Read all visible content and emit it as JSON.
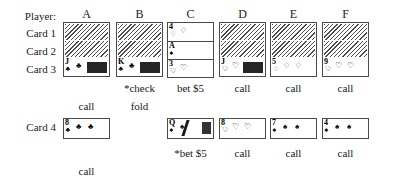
{
  "table": {
    "row_labels": [
      {
        "text": "Player:",
        "x": 8,
        "y": 11,
        "w": 48
      },
      {
        "text": "Card 1",
        "x": 8,
        "y": 28,
        "w": 48
      },
      {
        "text": "Card 2",
        "x": 8,
        "y": 46,
        "w": 48
      },
      {
        "text": "Card 3",
        "x": 8,
        "y": 64,
        "w": 48
      },
      {
        "text": "Card 4",
        "x": 8,
        "y": 122,
        "w": 48
      }
    ],
    "columns": [
      {
        "id": "A",
        "label": "A",
        "header_x": 63,
        "stack_x": 63
      },
      {
        "id": "B",
        "label": "B",
        "header_x": 116,
        "stack_x": 116
      },
      {
        "id": "C",
        "label": "C",
        "header_x": 167,
        "stack_x": 167
      },
      {
        "id": "D",
        "label": "D",
        "header_x": 219,
        "stack_x": 219
      },
      {
        "id": "E",
        "label": "E",
        "header_x": 270,
        "stack_x": 270
      },
      {
        "id": "F",
        "label": "F",
        "header_x": 322,
        "stack_x": 322
      }
    ],
    "header_y": 8,
    "stack_top": 22,
    "card4_top": 118
  },
  "hands": [
    {
      "player": "A",
      "hole_cards": [
        {
          "facedown": true
        },
        {
          "facedown": true
        }
      ],
      "card3": {
        "rank": "J",
        "suit": "♣",
        "suit_name": "clubs",
        "pips": 1,
        "obscured": true,
        "smudge": "wide"
      },
      "card4": {
        "rank": "8",
        "suit": "♣",
        "suit_name": "clubs",
        "pips": 2,
        "obscured": false
      },
      "actions": [
        {
          "text": "call",
          "round": 2
        },
        {
          "text": "call",
          "round": 4
        }
      ]
    },
    {
      "player": "B",
      "hole_cards": [
        {
          "facedown": true
        },
        {
          "facedown": true
        }
      ],
      "card3": {
        "rank": "K",
        "suit": "♣",
        "suit_name": "clubs",
        "pips": 1,
        "obscured": true,
        "smudge": "wide"
      },
      "card4": null,
      "actions": [
        {
          "text": "*check",
          "round": 1
        },
        {
          "text": "fold",
          "round": 2
        }
      ]
    },
    {
      "player": "C",
      "hole_cards": [
        {
          "rank": "4",
          "suit": "♢",
          "suit_name": "diamonds",
          "pips": 1,
          "facedown": false
        },
        {
          "rank": "A",
          "suit": "♠",
          "suit_name": "spades",
          "pips": 0,
          "facedown": false
        }
      ],
      "card3": {
        "rank": "3",
        "suit": "♡",
        "suit_name": "hearts",
        "pips": 1,
        "obscured": false
      },
      "card4": {
        "rank": "Q",
        "suit": "♠",
        "suit_name": "spades",
        "pips": 1,
        "obscured": true,
        "smudge": "slash"
      },
      "actions": [
        {
          "text": "bet $5",
          "round": 1
        },
        {
          "text": "*bet $5",
          "round": 3
        }
      ]
    },
    {
      "player": "D",
      "hole_cards": [
        {
          "facedown": true
        },
        {
          "facedown": true
        }
      ],
      "card3": {
        "rank": "J",
        "suit": "♡",
        "suit_name": "hearts",
        "pips": 1,
        "obscured": true,
        "smudge": "wide"
      },
      "card4": {
        "rank": "8",
        "suit": "♡",
        "suit_name": "hearts",
        "pips": 2,
        "obscured": false
      },
      "actions": [
        {
          "text": "call",
          "round": 1
        },
        {
          "text": "call",
          "round": 3
        }
      ]
    },
    {
      "player": "E",
      "hole_cards": [
        {
          "facedown": true
        },
        {
          "facedown": true
        }
      ],
      "card3": {
        "rank": "5",
        "suit": "♢",
        "suit_name": "diamonds",
        "pips": 2,
        "obscured": false
      },
      "card4": {
        "rank": "7",
        "suit": "♠",
        "suit_name": "spades",
        "pips": 2,
        "obscured": false
      },
      "actions": [
        {
          "text": "call",
          "round": 1
        },
        {
          "text": "call",
          "round": 3
        }
      ]
    },
    {
      "player": "F",
      "hole_cards": [
        {
          "facedown": true
        },
        {
          "facedown": true
        }
      ],
      "card3": {
        "rank": "9",
        "suit": "♡",
        "suit_name": "hearts",
        "pips": 2,
        "obscured": false
      },
      "card4": {
        "rank": "4",
        "suit": "♠",
        "suit_name": "spades",
        "pips": 2,
        "obscured": false
      },
      "actions": [
        {
          "text": "call",
          "round": 1
        },
        {
          "text": "call",
          "round": 3
        }
      ]
    }
  ],
  "action_rows": {
    "round1_y": 83,
    "round2_y": 101,
    "round3_y": 148,
    "round4_y": 166
  },
  "colors": {
    "ink": "#1a1a1a",
    "card_border": "#4a4a4a",
    "hatch": "#4d4d4d",
    "page_bg": "#ffffff"
  }
}
